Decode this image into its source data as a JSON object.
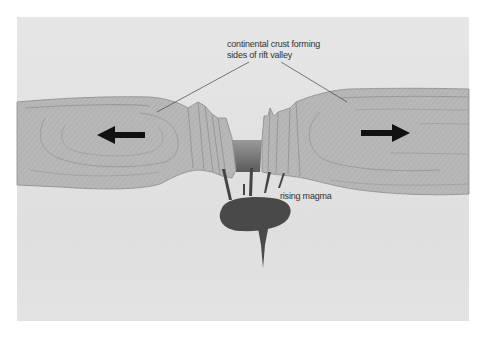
{
  "diagram": {
    "type": "rift valley cross-section",
    "labels": {
      "crust_line1": "continental crust forming",
      "crust_line2": "sides of rift valley",
      "magma": "rising magma"
    },
    "arrows": [
      {
        "direction": "left",
        "meaning": "plate moving apart"
      },
      {
        "direction": "right",
        "meaning": "plate moving apart"
      }
    ],
    "colors": {
      "background": "#e3e3e3",
      "crust": "#b3b3b3",
      "crust_outline": "#8a8a8a",
      "magma": "#4a4a4a",
      "arrow": "#111111",
      "leader_line": "#444444"
    }
  }
}
